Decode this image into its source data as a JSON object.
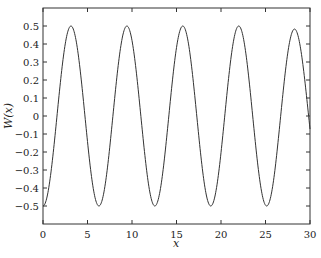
{
  "chart_data": {
    "type": "line",
    "title": "",
    "xlabel": "x",
    "ylabel": "W(x)",
    "xlim": [
      0,
      30
    ],
    "ylim": [
      -0.6,
      0.6
    ],
    "grid": false,
    "legend": null,
    "xticks": [
      0,
      5,
      10,
      15,
      20,
      25,
      30
    ],
    "xtick_labels": [
      "0",
      "5",
      "10",
      "15",
      "20",
      "25",
      "30"
    ],
    "yticks": [
      -0.5,
      -0.4,
      -0.3,
      -0.2,
      -0.1,
      0,
      0.1,
      0.2,
      0.3,
      0.4,
      0.5
    ],
    "ytick_labels": [
      "−0.5",
      "−0.4",
      "−0.3",
      "−0.2",
      "−0.1",
      "0",
      "0.1",
      "0.2",
      "0.3",
      "0.4",
      "0.5"
    ],
    "series": [
      {
        "name": "W(x)",
        "color": "#333333",
        "description": "Oscillation approximately -0.5*cos(x), last peak slightly damped (~0.47)",
        "x": [
          0,
          1.57,
          3.14,
          4.71,
          6.28,
          7.85,
          9.42,
          11.0,
          12.57,
          14.14,
          15.71,
          17.28,
          18.85,
          20.42,
          21.99,
          23.56,
          25.13,
          26.7,
          28.27,
          29.5,
          30
        ],
        "y": [
          -0.5,
          0.0,
          0.5,
          0.0,
          -0.5,
          0.0,
          0.5,
          0.0,
          -0.5,
          0.0,
          0.5,
          0.0,
          -0.5,
          0.0,
          0.5,
          0.0,
          -0.5,
          0.0,
          0.47,
          0.2,
          -0.05
        ]
      }
    ]
  }
}
